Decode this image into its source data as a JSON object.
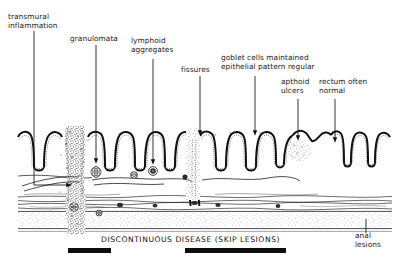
{
  "figure": {
    "background_color": "#ffffff",
    "ink_color": "#111111",
    "width": 409,
    "height": 263
  },
  "labels": {
    "transmural_inflammation": "transmural\ninflammation",
    "granulomata": "granulomata",
    "lymphoid_aggregates": "lymphoid\naggregates",
    "fissures": "fissures",
    "goblet_cells": "goblet cells maintained\nepithelial pattern regular",
    "apthoid_ulcers": "apthoid\nulcers",
    "rectum_often_normal": "rectum often\nnormal",
    "anal_lesions": "anal\nlesions"
  },
  "caption": {
    "text": "DISCONTINUOUS DISEASE (SKIP LESIONS)"
  },
  "disease_bars": [
    {
      "name": "skip-lesion-bar-left",
      "x": 68,
      "y": 248,
      "width": 43,
      "height": 5
    },
    {
      "name": "skip-lesion-bar-right",
      "x": 185,
      "y": 248,
      "width": 101,
      "height": 5
    }
  ],
  "leader_lines": [
    {
      "name": "leader-transmural-inflammation",
      "shape": "elbow",
      "x": 34,
      "y_top": 30,
      "y_bottom": 185,
      "x_end": 72,
      "arrow": "right"
    },
    {
      "name": "leader-granulomata",
      "shape": "vertical",
      "x": 96,
      "y_top": 44,
      "y_bottom": 163,
      "arrow": "down"
    },
    {
      "name": "leader-lymphoid-aggregates",
      "shape": "vertical",
      "x": 153,
      "y_top": 58,
      "y_bottom": 163,
      "arrow": "down"
    },
    {
      "name": "leader-fissures",
      "shape": "vertical",
      "x": 200,
      "y_top": 75,
      "y_bottom": 137,
      "arrow": "down"
    },
    {
      "name": "leader-goblet-cells",
      "shape": "vertical",
      "x": 255,
      "y_top": 75,
      "y_bottom": 137,
      "arrow": "down"
    },
    {
      "name": "leader-apthoid-ulcers",
      "shape": "vertical",
      "x": 298,
      "y_top": 98,
      "y_bottom": 141,
      "arrow": "down"
    },
    {
      "name": "leader-rectum-normal",
      "shape": "vertical",
      "x": 335,
      "y_top": 98,
      "y_bottom": 143,
      "arrow": "down"
    },
    {
      "name": "leader-anal-lesions",
      "shape": "vertical",
      "x": 366,
      "y_top": 218,
      "y_bottom": 232,
      "arrow": "none"
    }
  ],
  "anatomy": {
    "mucosa_top": 130,
    "mucosa_base": 172,
    "muscle_layer_top": 196,
    "muscle_layer_bottom": 212,
    "serosa_top": 212,
    "serosa_bottom": 228,
    "lumen_left": 18,
    "lumen_right": 392
  }
}
